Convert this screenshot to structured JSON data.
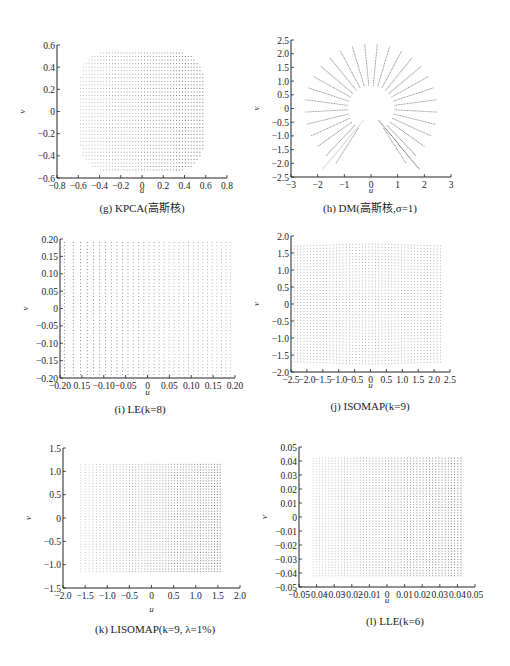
{
  "figure": {
    "panels": [
      {
        "id": "g",
        "caption": "(g) KPCA(高斯核)"
      },
      {
        "id": "h",
        "caption": "(h) DM(高斯核,σ=1)"
      },
      {
        "id": "i",
        "caption": "(i) LE(k=8)"
      },
      {
        "id": "j",
        "caption": "(j) ISOMAP(k=9)"
      },
      {
        "id": "k",
        "caption": "(k) LISOMAP(k=9, λ=1%)"
      },
      {
        "id": "l",
        "caption": "(l) LLE(k=6)"
      }
    ]
  },
  "chart_data": [
    {
      "type": "scatter",
      "title": "(g) KPCA(高斯核)",
      "xlabel": "u",
      "ylabel": "v",
      "xlim": [
        -0.8,
        0.8
      ],
      "ylim": [
        -0.6,
        0.6
      ],
      "xticks": [
        "-0.8",
        "-0.6",
        "-0.4",
        "-0.2",
        "0",
        "0.2",
        "0.4",
        "0.6",
        "0.8"
      ],
      "yticks": [
        "-0.6",
        "-0.4",
        "-0.2",
        "0",
        "0.2",
        "0.4",
        "0.6"
      ],
      "shape": "rounded square point grid",
      "extent": {
        "x": [
          -0.58,
          0.6
        ],
        "y": [
          -0.56,
          0.56
        ]
      },
      "grid": false
    },
    {
      "type": "scatter",
      "title": "(h) DM(高斯核,σ=1)",
      "xlabel": "u",
      "ylabel": "v",
      "xlim": [
        -3,
        3
      ],
      "ylim": [
        -2.5,
        2.5
      ],
      "xticks": [
        "-3",
        "-2",
        "-1",
        "0",
        "1",
        "2",
        "3"
      ],
      "yticks": [
        "-2.5",
        "-2.0",
        "-1.5",
        "-1.0",
        "-0.5",
        "0",
        "0.5",
        "1.0",
        "1.5",
        "2.0",
        "2.5"
      ],
      "shape": "radial spokes (fan) with inner radius ~0.9 and outer radius ~2.5",
      "extent": {
        "x": [
          -2.5,
          2.5
        ],
        "y": [
          -2.2,
          2.3
        ]
      },
      "grid": false
    },
    {
      "type": "scatter",
      "title": "(i) LE(k=8)",
      "xlabel": "u",
      "ylabel": "v",
      "xlim": [
        -0.2,
        0.2
      ],
      "ylim": [
        -0.2,
        0.2
      ],
      "xticks": [
        "-0.20",
        "0.15",
        "-0.10",
        "-0.05",
        "0",
        "0.05",
        "0.10",
        "0.15",
        "0.20"
      ],
      "yticks": [
        "-0.20",
        "-0.15",
        "-0.10",
        "-0.05",
        "0",
        "0.05",
        "0.10",
        "0.15",
        "0.20"
      ],
      "shape": "square point grid, denser near left edge",
      "extent": {
        "x": [
          -0.19,
          0.19
        ],
        "y": [
          -0.19,
          0.19
        ]
      },
      "grid": false
    },
    {
      "type": "scatter",
      "title": "(j) ISOMAP(k=9)",
      "xlabel": "u",
      "ylabel": "v",
      "xlim": [
        -2.5,
        2.5
      ],
      "ylim": [
        -2.0,
        2.0
      ],
      "xticks": [
        "-2.5",
        "-2.0",
        "-1.5",
        "-1.0",
        "-0.5",
        "0",
        "0.5",
        "1.0",
        "1.5",
        "2.0",
        "2.5"
      ],
      "yticks": [
        "-2.0",
        "-1.5",
        "-1.0",
        "-0.5",
        "0",
        "0.5",
        "1.0",
        "1.5",
        "2.0"
      ],
      "shape": "rectangular point grid",
      "extent": {
        "x": [
          -2.4,
          2.2
        ],
        "y": [
          -1.7,
          1.7
        ]
      },
      "grid": false
    },
    {
      "type": "scatter",
      "title": "(k) LISOMAP(k=9, λ=1%)",
      "xlabel": "u",
      "ylabel": "v",
      "xlim": [
        -2.0,
        2.0
      ],
      "ylim": [
        -1.5,
        1.5
      ],
      "xticks": [
        "-2.0",
        "-1.5",
        "-1.0",
        "-0.5",
        "0",
        "0.5",
        "1.0",
        "1.5",
        "2.0"
      ],
      "yticks": [
        "-1.5",
        "-1.0",
        "-0.5",
        "0",
        "0.5",
        "1.0",
        "1.5"
      ],
      "shape": "rectangular point grid, denser on right",
      "extent": {
        "x": [
          -1.6,
          1.55
        ],
        "y": [
          -1.15,
          1.15
        ]
      },
      "grid": false
    },
    {
      "type": "scatter",
      "title": "(l) LLE(k=6)",
      "xlabel": "u",
      "ylabel": "v",
      "xlim": [
        -0.05,
        0.05
      ],
      "ylim": [
        -0.05,
        0.05
      ],
      "xticks": [
        "-0.05",
        "-0.04",
        "-0.03",
        "-0.02",
        "-0.01",
        "0",
        "0.01",
        "0.02",
        "0.03",
        "0.04",
        "0.05"
      ],
      "yticks": [
        "-0.05",
        "-0.04",
        "-0.03",
        "-0.02",
        "-0.01",
        "0",
        "0.01",
        "0.02",
        "0.03",
        "0.04",
        "0.05"
      ],
      "shape": "square point grid, denser on right",
      "extent": {
        "x": [
          -0.042,
          0.042
        ],
        "y": [
          -0.042,
          0.042
        ]
      },
      "grid": false
    }
  ]
}
